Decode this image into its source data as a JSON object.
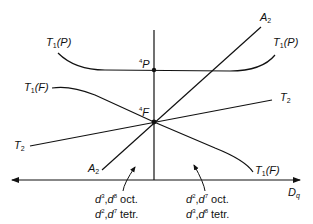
{
  "diagram": {
    "type": "Orgel diagram",
    "axis": {
      "x_label": "Dq",
      "x_label_main": "D",
      "x_label_sub": "q"
    },
    "terms": {
      "P": {
        "mult": "4",
        "letter": "P"
      },
      "F": {
        "mult": "4",
        "letter": "F"
      }
    },
    "curves": {
      "T1P_left": {
        "main": "T",
        "sub": "1",
        "paren": "(P)"
      },
      "T1P_right": {
        "main": "T",
        "sub": "1",
        "paren": "(P)"
      },
      "T1F_left": {
        "main": "T",
        "sub": "1",
        "paren": "(F)"
      },
      "T1F_right": {
        "main": "T",
        "sub": "1",
        "paren": "(F)"
      },
      "T2_left": {
        "main": "T",
        "sub": "2"
      },
      "T2_right": {
        "main": "T",
        "sub": "2"
      },
      "A2_top": {
        "main": "A",
        "sub": "2"
      },
      "A2_bottom": {
        "main": "A",
        "sub": "2"
      }
    },
    "regions": {
      "left": {
        "line1": {
          "a": "d",
          "a_sup": "3",
          "b": "d",
          "b_sup": "8",
          "geom": " oct."
        },
        "line2": {
          "a": "d",
          "a_sup": "2",
          "b": "d",
          "b_sup": "7",
          "geom": " tetr."
        }
      },
      "right": {
        "line1": {
          "a": "d",
          "a_sup": "2",
          "b": "d",
          "b_sup": "7",
          "geom": " oct."
        },
        "line2": {
          "a": "d",
          "a_sup": "3",
          "b": "d",
          "b_sup": "8",
          "geom": " tetr."
        }
      }
    },
    "colors": {
      "line": "#111111",
      "background": "#ffffff"
    }
  }
}
